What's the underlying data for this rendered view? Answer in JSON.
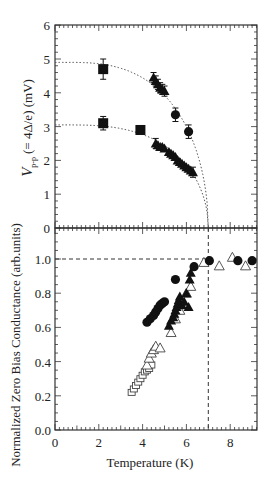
{
  "chart_data": [
    {
      "panel": "top",
      "type": "scatter",
      "title": "",
      "xlabel": "Temperature  (K)",
      "ylabel_main": "V",
      "ylabel_sub": "p-p",
      "ylabel_rest": "(= 4Δ/e)  (mV)",
      "xlim": [
        0,
        9.2
      ],
      "ylim": [
        0,
        6
      ],
      "yticks": [
        "0",
        "1",
        "2",
        "3",
        "4",
        "5",
        "6"
      ],
      "grid": false,
      "series": [
        {
          "name": "upper gap squares",
          "marker": "filled-square",
          "x": [
            2.2
          ],
          "y": [
            4.7
          ],
          "yerr": [
            0.3
          ]
        },
        {
          "name": "upper gap triangles",
          "marker": "filled-triangle",
          "x": [
            4.5,
            4.6,
            4.7,
            4.8,
            4.9,
            5.0
          ],
          "y": [
            4.45,
            4.35,
            4.25,
            4.15,
            4.1,
            4.05
          ],
          "yerr": [
            0.15,
            0.15,
            0.15,
            0.15,
            0.15,
            0.15
          ]
        },
        {
          "name": "upper gap circles",
          "marker": "filled-circle",
          "x": [
            5.5,
            6.1
          ],
          "y": [
            3.35,
            2.85
          ],
          "yerr": [
            0.2,
            0.2
          ]
        },
        {
          "name": "lower gap squares",
          "marker": "filled-square",
          "x": [
            2.2,
            3.9
          ],
          "y": [
            3.1,
            2.9
          ],
          "yerr": [
            0.2,
            0.0
          ]
        },
        {
          "name": "lower gap triangles",
          "marker": "filled-triangle",
          "x": [
            4.6,
            4.7,
            4.8,
            4.9,
            5.0,
            5.2,
            5.3,
            5.4,
            5.5,
            5.6,
            5.7,
            5.8,
            5.9,
            6.0,
            6.1,
            6.2,
            6.3
          ],
          "y": [
            2.5,
            2.45,
            2.4,
            2.4,
            2.35,
            2.25,
            2.2,
            2.15,
            2.1,
            2.0,
            1.95,
            1.9,
            1.85,
            1.8,
            1.75,
            1.7,
            1.65
          ],
          "yerr": [
            0.15,
            0,
            0,
            0,
            0,
            0,
            0,
            0,
            0,
            0,
            0,
            0,
            0,
            0,
            0,
            0,
            0.15
          ]
        },
        {
          "name": "fit upper (dotted)",
          "line": "dotted",
          "Tc": 7.0,
          "V0": 4.9
        },
        {
          "name": "fit lower (dotted)",
          "line": "dotted",
          "Tc": 7.0,
          "V0": 3.05
        }
      ]
    },
    {
      "panel": "bottom",
      "type": "scatter",
      "title": "",
      "xlabel": "Temperature  (K)",
      "ylabel": "Normalized Zero Bias Conductance  (arb.units)",
      "xlim": [
        0,
        9.2
      ],
      "ylim": [
        0,
        1.18
      ],
      "xticks": [
        "0",
        "2",
        "4",
        "6",
        "8"
      ],
      "yticks": [
        "0.0",
        "0.2",
        "0.4",
        "0.6",
        "0.8",
        "1.0"
      ],
      "extra_tick_label": "0",
      "grid": false,
      "reference_lines": [
        {
          "type": "horizontal-dashed",
          "y": 1.0,
          "x_to": 7.0
        },
        {
          "type": "vertical-dashed",
          "x": 7.0
        }
      ],
      "series": [
        {
          "name": "filled circles",
          "marker": "filled-circle",
          "x": [
            4.2,
            4.35,
            4.5,
            4.6,
            4.7,
            4.8,
            4.9,
            5.0,
            5.5,
            6.35,
            7.05,
            8.35,
            9.0
          ],
          "y": [
            0.63,
            0.65,
            0.67,
            0.69,
            0.71,
            0.73,
            0.74,
            0.75,
            0.88,
            0.955,
            0.99,
            0.99,
            0.99
          ]
        },
        {
          "name": "filled triangles",
          "marker": "filled-triangle",
          "x": [
            5.2,
            5.3,
            5.4,
            5.45,
            5.5,
            5.55,
            5.6,
            5.65,
            5.7,
            5.8,
            5.9,
            6.0,
            6.1,
            6.15,
            6.2
          ],
          "y": [
            0.61,
            0.64,
            0.66,
            0.68,
            0.7,
            0.72,
            0.74,
            0.76,
            0.78,
            0.73,
            0.75,
            0.8,
            0.72,
            0.88,
            0.92
          ]
        },
        {
          "name": "open triangles",
          "marker": "open-triangle",
          "x": [
            4.2,
            4.3,
            4.4,
            4.5,
            4.6,
            4.8,
            5.3,
            5.5,
            5.7,
            6.0,
            6.2,
            6.8,
            7.5,
            8.1,
            8.7
          ],
          "y": [
            0.38,
            0.42,
            0.45,
            0.47,
            0.49,
            0.48,
            0.57,
            0.65,
            0.7,
            0.8,
            0.84,
            0.98,
            0.96,
            1.01,
            0.96
          ]
        },
        {
          "name": "open squares",
          "marker": "open-square",
          "x": [
            3.5,
            3.6,
            3.7,
            3.8,
            3.9,
            4.0,
            4.1,
            4.2,
            4.3,
            4.4
          ],
          "y": [
            0.22,
            0.24,
            0.26,
            0.28,
            0.3,
            0.32,
            0.34,
            0.35,
            0.36,
            0.38
          ]
        }
      ]
    }
  ],
  "labels": {
    "top_ylabel_main": "V",
    "top_ylabel_sub": "p-p",
    "top_ylabel_rest": "(= 4Δ/e)  (mV)",
    "bottom_ylabel": "Normalized Zero Bias Conductance  (arb.units)",
    "xlabel": "Temperature  (K)"
  },
  "colors": {
    "marker": "#111111",
    "axis": "#333333",
    "text": "#222222",
    "background": "#ffffff"
  }
}
